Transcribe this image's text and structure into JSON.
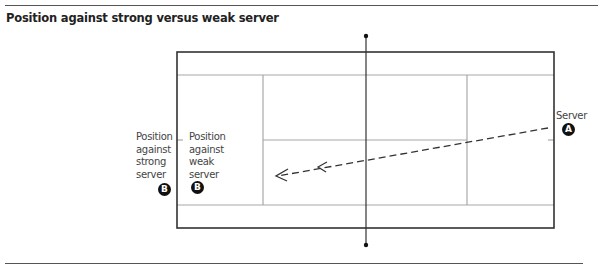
{
  "figure": {
    "title": "Position against strong versus weak server"
  },
  "labels": {
    "strong_server_position": [
      "Position",
      "against",
      "strong",
      "server"
    ],
    "weak_server_position": [
      "Position",
      "against",
      "weak",
      "server"
    ],
    "server": "Server"
  },
  "markers": {
    "server": "A",
    "strong_receiver": "B",
    "weak_receiver": "B"
  },
  "colors": {
    "outer_lines": "#333333",
    "inner_lines": "#aaaaaa",
    "net": "#333333",
    "arrow": "#333333",
    "badge": "#111111"
  }
}
